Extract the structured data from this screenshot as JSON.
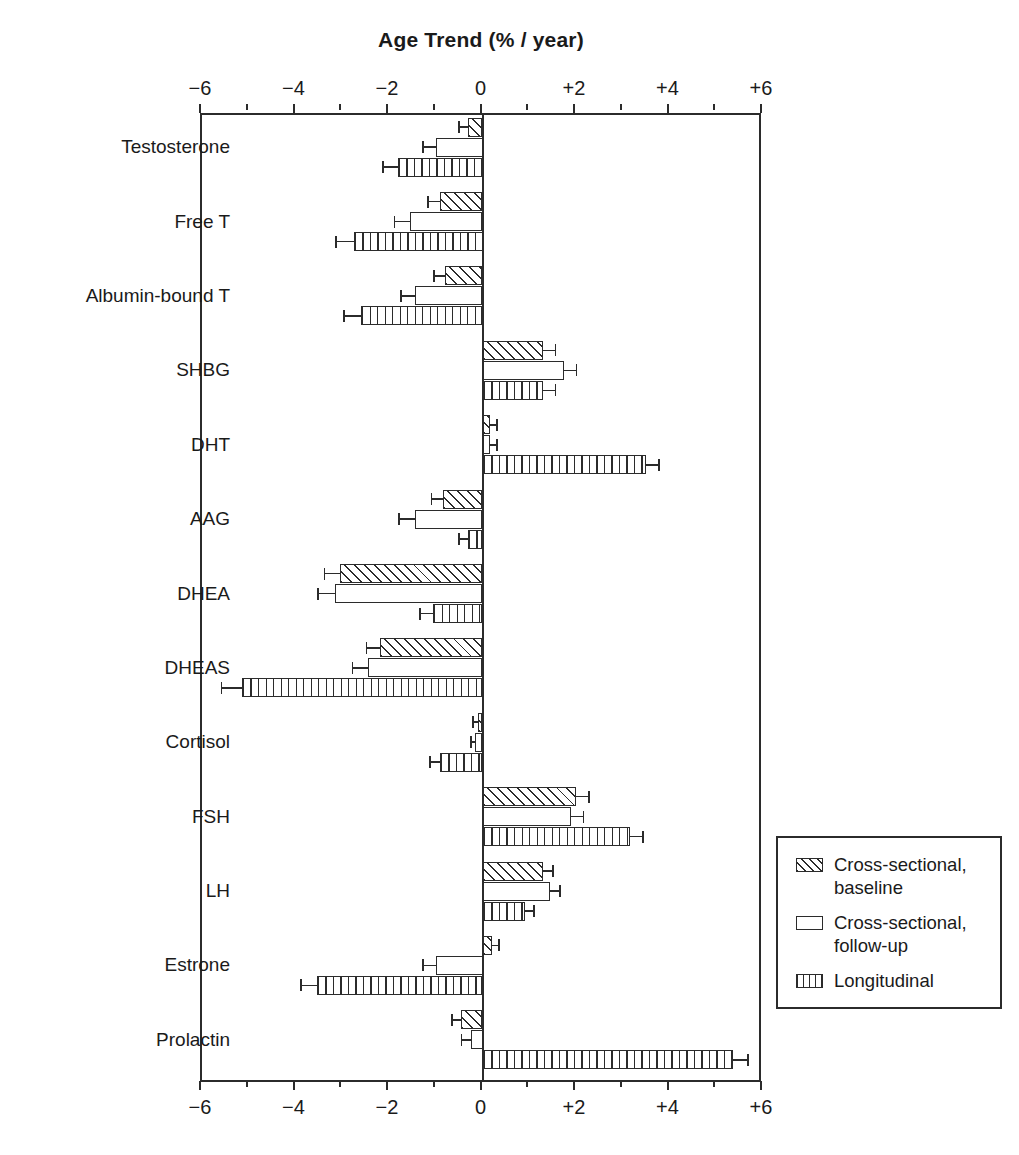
{
  "chart_data": {
    "type": "bar",
    "orientation": "horizontal",
    "title": "Age Trend (% / year)",
    "xlabel": "",
    "ylabel": "",
    "xlim": [
      -6,
      6
    ],
    "grid": false,
    "axis_top": true,
    "axis_bottom": true,
    "tick_labels": [
      "−6",
      "−4",
      "−2",
      "0",
      "+2",
      "+4",
      "+6"
    ],
    "tick_values": [
      -6,
      -4,
      -2,
      0,
      2,
      4,
      6
    ],
    "minor_tick_step": 1,
    "legend_position": "right-lower",
    "categories": [
      "Testosterone",
      "Free T",
      "Albumin-bound T",
      "SHBG",
      "DHT",
      "AAG",
      "DHEA",
      "DHEAS",
      "Cortisol",
      "FSH",
      "LH",
      "Estrone",
      "Prolactin"
    ],
    "series": [
      {
        "name": "Cross-sectional, baseline",
        "pattern": "diagonal-hatch",
        "values": [
          -0.3,
          -0.9,
          -0.8,
          1.3,
          0.15,
          -0.85,
          -3.05,
          -2.2,
          -0.1,
          2.0,
          1.3,
          0.2,
          -0.45
        ],
        "errors": [
          0.22,
          0.28,
          0.26,
          0.28,
          0.18,
          0.26,
          0.35,
          0.3,
          0.12,
          0.3,
          0.22,
          0.18,
          0.22
        ]
      },
      {
        "name": "Cross-sectional, follow-up",
        "pattern": "solid-white",
        "values": [
          -1.0,
          -1.55,
          -1.45,
          1.75,
          0.15,
          -1.45,
          -3.15,
          -2.45,
          -0.15,
          1.9,
          1.45,
          -1.0,
          -0.25
        ],
        "errors": [
          0.3,
          0.35,
          0.32,
          0.28,
          0.18,
          0.35,
          0.38,
          0.35,
          0.12,
          0.28,
          0.22,
          0.3,
          0.22
        ]
      },
      {
        "name": "Longitudinal",
        "pattern": "vertical-lines",
        "values": [
          -1.8,
          -2.75,
          -2.6,
          1.3,
          3.5,
          -0.3,
          -1.05,
          -5.15,
          -0.9,
          3.15,
          0.9,
          -3.55,
          5.35
        ],
        "errors": [
          0.35,
          0.4,
          0.38,
          0.28,
          0.3,
          0.22,
          0.3,
          0.45,
          0.25,
          0.3,
          0.22,
          0.35,
          0.35
        ]
      }
    ],
    "legend_entries": [
      "Cross-sectional,\nbaseline",
      "Cross-sectional,\nfollow-up",
      "Longitudinal"
    ],
    "colors": {
      "ink": "#2b2b2b",
      "background": "#ffffff",
      "bar_fill": "#ffffff"
    }
  }
}
